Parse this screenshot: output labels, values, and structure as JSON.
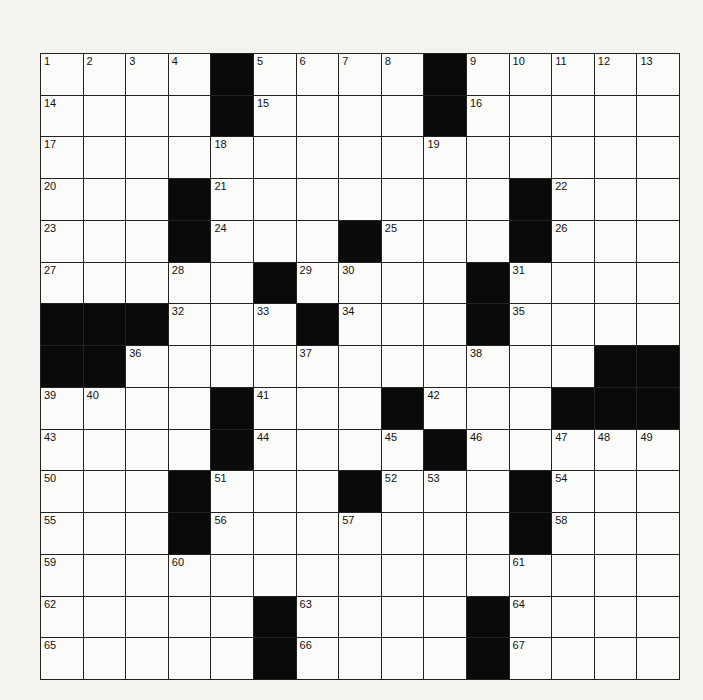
{
  "puzzle": {
    "size": 15,
    "rows": [
      "....#....#.....",
      "....#....#.....",
      "...............",
      "...#.......#...",
      "...#...#...#...",
      ".....#....#....",
      "###...#...#....",
      "##...........##",
      "....#...#...###",
      "....#....#.....",
      "...#...#...#...",
      "...#.......#...",
      "...............",
      ".....#....#....",
      ".....#....#...."
    ],
    "numbers": [
      [
        1,
        2,
        3,
        4,
        0,
        5,
        6,
        7,
        8,
        0,
        9,
        10,
        11,
        12,
        13
      ],
      [
        14,
        0,
        0,
        0,
        0,
        15,
        0,
        0,
        0,
        0,
        16,
        0,
        0,
        0,
        0
      ],
      [
        17,
        0,
        0,
        0,
        18,
        0,
        0,
        0,
        0,
        19,
        0,
        0,
        0,
        0,
        0
      ],
      [
        20,
        0,
        0,
        0,
        21,
        0,
        0,
        0,
        0,
        0,
        0,
        0,
        22,
        0,
        0
      ],
      [
        23,
        0,
        0,
        0,
        24,
        0,
        0,
        0,
        25,
        0,
        0,
        0,
        26,
        0,
        0
      ],
      [
        27,
        0,
        0,
        28,
        0,
        0,
        29,
        30,
        0,
        0,
        0,
        31,
        0,
        0,
        0
      ],
      [
        0,
        0,
        0,
        32,
        0,
        33,
        0,
        34,
        0,
        0,
        0,
        35,
        0,
        0,
        0
      ],
      [
        0,
        0,
        36,
        0,
        0,
        0,
        37,
        0,
        0,
        0,
        38,
        0,
        0,
        0,
        0
      ],
      [
        39,
        40,
        0,
        0,
        0,
        41,
        0,
        0,
        0,
        42,
        0,
        0,
        0,
        0,
        0
      ],
      [
        43,
        0,
        0,
        0,
        0,
        44,
        0,
        0,
        45,
        0,
        46,
        0,
        47,
        48,
        49
      ],
      [
        50,
        0,
        0,
        0,
        51,
        0,
        0,
        0,
        52,
        53,
        0,
        0,
        54,
        0,
        0
      ],
      [
        55,
        0,
        0,
        0,
        56,
        0,
        0,
        57,
        0,
        0,
        0,
        0,
        58,
        0,
        0
      ],
      [
        59,
        0,
        0,
        60,
        0,
        0,
        0,
        0,
        0,
        0,
        0,
        61,
        0,
        0,
        0
      ],
      [
        62,
        0,
        0,
        0,
        0,
        0,
        63,
        0,
        0,
        0,
        0,
        64,
        0,
        0,
        0
      ],
      [
        65,
        0,
        0,
        0,
        0,
        0,
        66,
        0,
        0,
        0,
        0,
        67,
        0,
        0,
        0
      ]
    ]
  }
}
